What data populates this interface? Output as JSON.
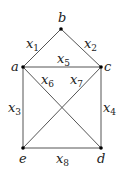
{
  "diagram": {
    "type": "graph",
    "nodes": [
      {
        "id": "b",
        "label": "b",
        "x": 61,
        "y": 29,
        "lx": 58,
        "ly": 22
      },
      {
        "id": "a",
        "label": "a",
        "x": 23,
        "y": 67,
        "lx": 11,
        "ly": 71
      },
      {
        "id": "c",
        "label": "c",
        "x": 101,
        "y": 67,
        "lx": 104,
        "ly": 71
      },
      {
        "id": "e",
        "label": "e",
        "x": 23,
        "y": 148,
        "lx": 19,
        "ly": 163
      },
      {
        "id": "d",
        "label": "d",
        "x": 101,
        "y": 148,
        "lx": 97,
        "ly": 163
      }
    ],
    "edges": [
      {
        "from": "a",
        "to": "b",
        "label": "x",
        "sub": "1",
        "lx": 26,
        "ly": 48
      },
      {
        "from": "b",
        "to": "c",
        "label": "x",
        "sub": "2",
        "lx": 84,
        "ly": 48
      },
      {
        "from": "a",
        "to": "c",
        "label": "x",
        "sub": "5",
        "lx": 57,
        "ly": 63
      },
      {
        "from": "a",
        "to": "e",
        "label": "x",
        "sub": "3",
        "lx": 8,
        "ly": 112
      },
      {
        "from": "c",
        "to": "d",
        "label": "x",
        "sub": "4",
        "lx": 103,
        "ly": 112
      },
      {
        "from": "a",
        "to": "d",
        "label": "x",
        "sub": "6",
        "lx": 41,
        "ly": 84
      },
      {
        "from": "c",
        "to": "e",
        "label": "x",
        "sub": "7",
        "lx": 70,
        "ly": 84
      },
      {
        "from": "e",
        "to": "d",
        "label": "x",
        "sub": "8",
        "lx": 56,
        "ly": 163
      }
    ]
  }
}
